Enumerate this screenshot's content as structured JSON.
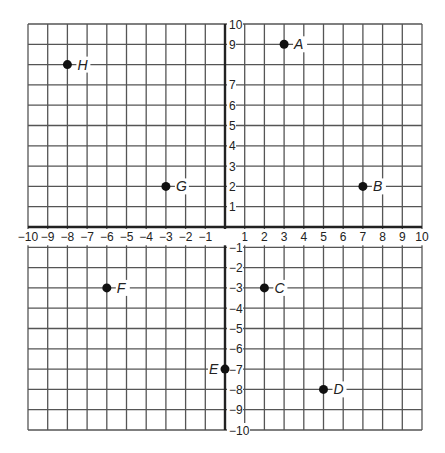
{
  "diagram": {
    "type": "coordinate-plane",
    "x_range": [
      -10,
      10
    ],
    "y_range": [
      -10,
      10
    ],
    "x_tick_labels": [
      "-10",
      "-9",
      "-8",
      "-7",
      "-6",
      "-5",
      "-4",
      "-3",
      "-2",
      "-1",
      "1",
      "2",
      "3",
      "4",
      "5",
      "6",
      "7",
      "8",
      "9",
      "10"
    ],
    "y_tick_labels": [
      "10",
      "9",
      "7",
      "6",
      "5",
      "4",
      "3",
      "2",
      "1",
      "-1",
      "-2",
      "-3",
      "-4",
      "-5",
      "-6",
      "-7",
      "-8",
      "-9",
      "-10"
    ],
    "grid": true,
    "colors": {
      "grid": "#555555",
      "axis": "#222222",
      "point": "#111111",
      "text": "#222222"
    },
    "points": [
      {
        "label": "A",
        "x": 3,
        "y": 9,
        "label_side": "right"
      },
      {
        "label": "B",
        "x": 7,
        "y": 2,
        "label_side": "right"
      },
      {
        "label": "C",
        "x": 2,
        "y": -3,
        "label_side": "right"
      },
      {
        "label": "D",
        "x": 5,
        "y": -8,
        "label_side": "right"
      },
      {
        "label": "E",
        "x": 0,
        "y": -7,
        "label_side": "left"
      },
      {
        "label": "F",
        "x": -6,
        "y": -3,
        "label_side": "right"
      },
      {
        "label": "G",
        "x": -3,
        "y": 2,
        "label_side": "right"
      },
      {
        "label": "H",
        "x": -8,
        "y": 8,
        "label_side": "right"
      }
    ]
  }
}
